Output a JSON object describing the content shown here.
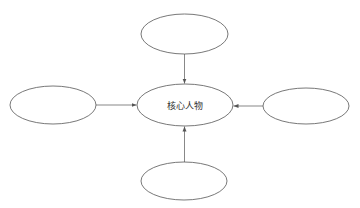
{
  "diagram": {
    "type": "concept-map",
    "top_cutoff_text": "",
    "nodes": [
      {
        "id": "center",
        "label": "核心人物",
        "cx": 185,
        "cy": 105,
        "rx": 48,
        "ry": 21
      },
      {
        "id": "top",
        "label": "",
        "cx": 184.5,
        "cy": 34,
        "rx": 43.5,
        "ry": 20
      },
      {
        "id": "left",
        "label": "",
        "cx": 53,
        "cy": 105,
        "rx": 43,
        "ry": 19
      },
      {
        "id": "right",
        "label": "",
        "cx": 306,
        "cy": 106,
        "rx": 43,
        "ry": 18
      },
      {
        "id": "bottom",
        "label": "",
        "cx": 184,
        "cy": 181,
        "rx": 43,
        "ry": 19
      }
    ],
    "edges": [
      {
        "from": "top",
        "to": "center"
      },
      {
        "from": "left",
        "to": "center"
      },
      {
        "from": "right",
        "to": "center"
      },
      {
        "from": "bottom",
        "to": "center"
      }
    ],
    "colors": {
      "stroke": "#555555",
      "text": "#333333",
      "background": "#ffffff"
    }
  }
}
